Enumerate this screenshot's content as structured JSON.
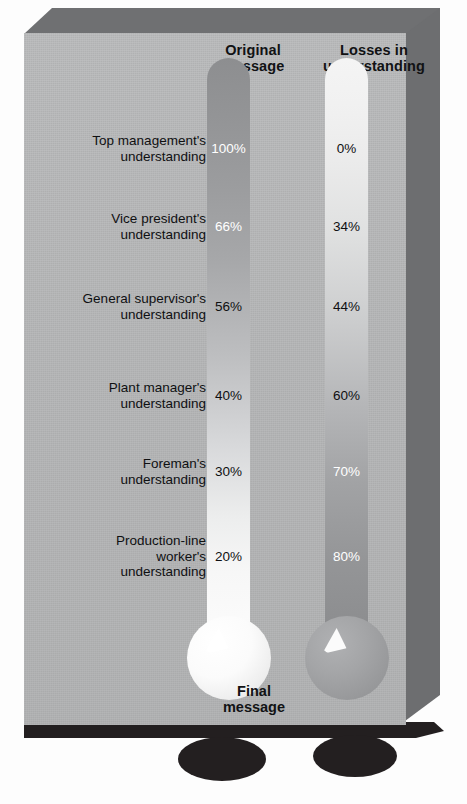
{
  "chart_data": {
    "type": "bar",
    "xlabel": "",
    "ylabel": "",
    "categories": [
      "Top management's understanding",
      "Vice president's understanding",
      "General supervisor's understanding",
      "Plant manager's understanding",
      "Foreman's understanding",
      "Production-line worker's understanding"
    ],
    "series": [
      {
        "name": "Original message",
        "values": [
          100,
          66,
          56,
          40,
          30,
          20
        ],
        "unit": "%"
      },
      {
        "name": "Losses in understanding",
        "values": [
          0,
          34,
          44,
          60,
          70,
          80
        ],
        "unit": "%"
      }
    ],
    "ylim": [
      0,
      100
    ],
    "grid": false,
    "legend": "top"
  },
  "columns": {
    "left": {
      "header_line1": "Original",
      "header_line2": "message",
      "footer_line1": "Final",
      "footer_line2": "message"
    },
    "right": {
      "header_line1": "Losses in",
      "header_line2": "understanding"
    }
  },
  "rows": [
    {
      "label_line1": "Top management's",
      "label_line2": "understanding",
      "label_line3": "",
      "left_value": "100%",
      "right_value": "0%",
      "left_text": "light",
      "right_text": "dark"
    },
    {
      "label_line1": "Vice president's",
      "label_line2": "understanding",
      "label_line3": "",
      "left_value": "66%",
      "right_value": "34%",
      "left_text": "light",
      "right_text": "dark"
    },
    {
      "label_line1": "General supervisor's",
      "label_line2": "understanding",
      "label_line3": "",
      "left_value": "56%",
      "right_value": "44%",
      "left_text": "dark",
      "right_text": "dark"
    },
    {
      "label_line1": "Plant manager's",
      "label_line2": "understanding",
      "label_line3": "",
      "left_value": "40%",
      "right_value": "60%",
      "left_text": "dark",
      "right_text": "dark"
    },
    {
      "label_line1": "Foreman's",
      "label_line2": "understanding",
      "label_line3": "",
      "left_value": "30%",
      "right_value": "70%",
      "left_text": "dark",
      "right_text": "light"
    },
    {
      "label_line1": "Production-line",
      "label_line2": "worker's",
      "label_line3": "understanding",
      "left_value": "20%",
      "right_value": "80%",
      "left_text": "dark",
      "right_text": "light"
    }
  ],
  "colors": {
    "panel_face": "#b5b6b7",
    "panel_bevel": "#6e6f71",
    "shadow": "#231f20",
    "text_dark": "#0f1012",
    "text_light": "#ffffff"
  }
}
